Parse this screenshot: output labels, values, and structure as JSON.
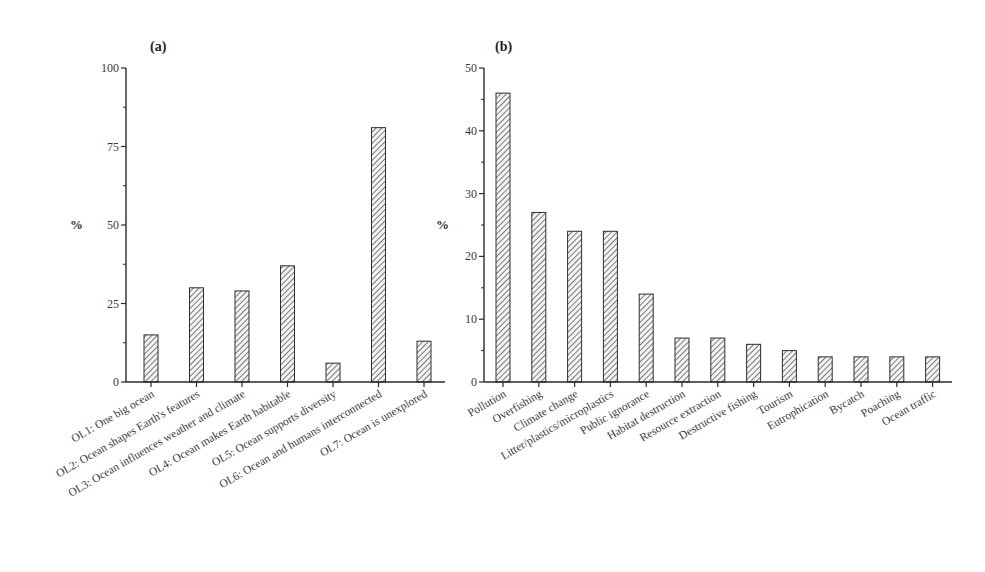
{
  "chart_data": [
    {
      "type": "bar",
      "panel": "(a)",
      "title": "(a)",
      "xlabel": "",
      "ylabel": "%",
      "ylim": [
        0,
        100
      ],
      "yticks": [
        0,
        25,
        50,
        75,
        100
      ],
      "grid": false,
      "pattern": "diagonal-hatch",
      "categories": [
        "OL1: One big ocean",
        "OL2: Ocean shapes Earth's features",
        "OL3: Ocean influences weather and climate",
        "OL4: Ocean makes Earth habitable",
        "OL5: Ocean supports diversity",
        "OL6: Ocean and humans interconnected",
        "OL7: Ocean is unexplored"
      ],
      "values": [
        15,
        30,
        29,
        37,
        6,
        81,
        13
      ]
    },
    {
      "type": "bar",
      "panel": "(b)",
      "title": "(b)",
      "xlabel": "",
      "ylabel": "%",
      "ylim": [
        0,
        50
      ],
      "yticks": [
        0,
        10,
        20,
        30,
        40,
        50
      ],
      "grid": false,
      "pattern": "diagonal-hatch",
      "categories": [
        "Pollution",
        "Overfishing",
        "Climate change",
        "Litter/plastics/microplastics",
        "Public ignorance",
        "Habitat destruction",
        "Resource extraction",
        "Destructive fishing",
        "Tourism",
        "Eutrophication",
        "Bycatch",
        "Poaching",
        "Ocean traffic"
      ],
      "values": [
        46,
        27,
        24,
        24,
        14,
        7,
        7,
        6,
        5,
        4,
        4,
        4,
        4
      ]
    }
  ]
}
